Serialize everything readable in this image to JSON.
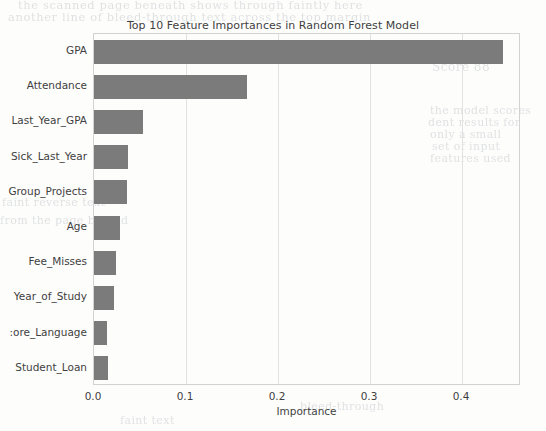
{
  "chart_data": {
    "type": "bar",
    "orientation": "horizontal",
    "title": "Top 10 Feature Importances in Random Forest Model",
    "xlabel": "Importance",
    "ylabel": "",
    "categories": [
      "GPA",
      "Attendance",
      "Last_Year_GPA",
      "Sick_Last_Year",
      "Group_Projects",
      "Age",
      "Fee_Misses",
      "Year_of_Study",
      ":ore_Language",
      "Student_Loan"
    ],
    "values": [
      0.445,
      0.166,
      0.053,
      0.037,
      0.036,
      0.028,
      0.024,
      0.022,
      0.014,
      0.015
    ],
    "xticks": [
      "0.0",
      "0.1",
      "0.2",
      "0.3",
      "0.4"
    ],
    "xtick_values": [
      0.0,
      0.1,
      0.2,
      0.3,
      0.4
    ],
    "xlim": [
      0.0,
      0.4641
    ],
    "grid": "vertical",
    "legend": "none",
    "bar_color": "#7b7b7b",
    "grid_color": "#e2e2e2",
    "frame_color": "#d2d2d2",
    "text_color": "#3f3f3f"
  },
  "background_ghost_text": {
    "top_line_1": "the scanned page beneath shows through faintly here",
    "top_line_2": "another line of bleed-through text across the top margin",
    "right_1": "Score 88",
    "right_2": "the model scores",
    "right_3": "dent results for",
    "right_4": "only a small",
    "right_5": "set of input",
    "right_6": "features used",
    "left_1": "faint reverse text",
    "left_2": "from the page behind",
    "bottom_1": "bleed-through",
    "bottom_2": "faint text"
  }
}
